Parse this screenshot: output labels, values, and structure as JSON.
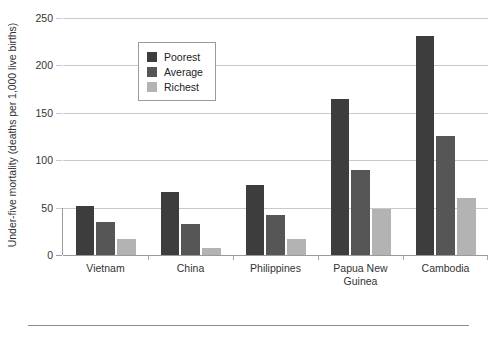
{
  "chart_data": {
    "type": "bar",
    "title": "",
    "xlabel": "",
    "ylabel": "Under-five mortality (deaths per 1,000 live births)",
    "ylim": [
      0,
      250
    ],
    "yticks": [
      0,
      50,
      100,
      150,
      200,
      250
    ],
    "ytick_labels": [
      "0",
      "50",
      "100",
      "150",
      "200",
      "250"
    ],
    "grid": true,
    "legend_position": "upper-center-left-inside",
    "categories": [
      "Vietnam",
      "China",
      "Philippines",
      "Papua New\nGuinea",
      "Cambodia"
    ],
    "category_labels": [
      {
        "line1": "Vietnam",
        "line2": ""
      },
      {
        "line1": "China",
        "line2": ""
      },
      {
        "line1": "Philippines",
        "line2": ""
      },
      {
        "line1": "Papua New",
        "line2": "Guinea"
      },
      {
        "line1": "Cambodia",
        "line2": ""
      }
    ],
    "series": [
      {
        "name": "Poorest",
        "color": "#3d3d3d",
        "values": [
          52,
          66,
          74,
          165,
          231
        ]
      },
      {
        "name": "Average",
        "color": "#565656",
        "values": [
          35,
          33,
          42,
          90,
          126
        ]
      },
      {
        "name": "Richest",
        "color": "#b3b3b3",
        "values": [
          17,
          7,
          17,
          49,
          60
        ]
      }
    ]
  },
  "legend": {
    "items": [
      {
        "label": "Poorest",
        "color": "#3d3d3d"
      },
      {
        "label": "Average",
        "color": "#565656"
      },
      {
        "label": "Richest",
        "color": "#b3b3b3"
      }
    ]
  },
  "colors": {
    "gridline": "#c9c9c9",
    "axis": "#9a9a9a",
    "text": "#333333",
    "background": "#ffffff"
  }
}
